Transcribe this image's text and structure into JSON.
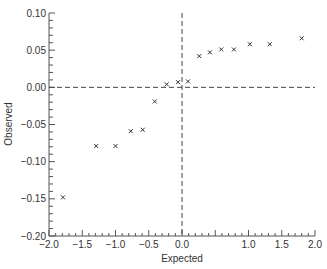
{
  "chart_data": {
    "type": "scatter",
    "title": "",
    "xlabel": "Expected",
    "ylabel": "Observed",
    "xlim": [
      -2.0,
      2.0
    ],
    "ylim": [
      -0.2,
      0.1
    ],
    "x_tick_labels": [
      "−2.0",
      "−1.5",
      "−1.0",
      "−0.5",
      "0.0",
      "1.0",
      "1.5",
      "2.0"
    ],
    "x_tick_values": [
      -2.0,
      -1.5,
      -1.0,
      -0.5,
      0.0,
      1.0,
      1.5,
      2.0
    ],
    "y_tick_labels": [
      "0.10",
      "0.05",
      "0.00",
      "−0.05",
      "−0.10",
      "−0.15",
      "−0.20"
    ],
    "y_tick_values": [
      0.1,
      0.05,
      0.0,
      -0.05,
      -0.1,
      -0.15,
      -0.2
    ],
    "grid": false,
    "legend": null,
    "marker": "x",
    "reference_lines": [
      {
        "orientation": "horizontal",
        "value": 0.0,
        "style": "dashed"
      },
      {
        "orientation": "vertical",
        "value": 0.0,
        "style": "dashed"
      }
    ],
    "points": [
      {
        "x": -1.79,
        "y": -0.148
      },
      {
        "x": -1.29,
        "y": -0.079
      },
      {
        "x": -1.0,
        "y": -0.079
      },
      {
        "x": -0.77,
        "y": -0.059
      },
      {
        "x": -0.59,
        "y": -0.057
      },
      {
        "x": -0.41,
        "y": -0.019
      },
      {
        "x": -0.23,
        "y": 0.004
      },
      {
        "x": -0.06,
        "y": 0.007
      },
      {
        "x": 0.09,
        "y": 0.008
      },
      {
        "x": 0.26,
        "y": 0.042
      },
      {
        "x": 0.42,
        "y": 0.047
      },
      {
        "x": 0.59,
        "y": 0.051
      },
      {
        "x": 0.78,
        "y": 0.051
      },
      {
        "x": 1.02,
        "y": 0.058
      },
      {
        "x": 1.32,
        "y": 0.058
      },
      {
        "x": 1.8,
        "y": 0.066
      }
    ],
    "colors": {
      "axis": "#555555",
      "marker": "#333333",
      "reference_line": "#444444",
      "text": "#333333"
    }
  }
}
